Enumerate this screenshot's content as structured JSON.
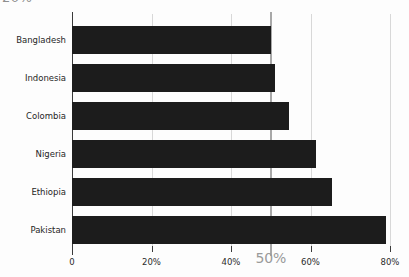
{
  "title_fragment": "20%",
  "chart_data": {
    "type": "bar",
    "orientation": "horizontal",
    "title": "",
    "subtitle": "",
    "xlabel": "",
    "ylabel": "",
    "categories": [
      "Bangladesh",
      "Indonesia",
      "Colombia",
      "Nigeria",
      "Ethiopia",
      "Pakistan"
    ],
    "values": [
      50,
      51,
      54.5,
      61.5,
      65.5,
      79
    ],
    "series": [
      {
        "name": "",
        "values": [
          50,
          51,
          54.5,
          61.5,
          65.5,
          79
        ]
      }
    ],
    "xlim": [
      0,
      80
    ],
    "ylim": null,
    "grid": true,
    "grid_axis": "x",
    "legend": false,
    "legend_position": "none",
    "bar_color": "#1c1c1c",
    "gridline_color": "#d8d8d8",
    "reference_line": {
      "value": 50,
      "label": "50%",
      "color": "#a8a8a8",
      "label_color": "#9a9a9a"
    },
    "xticks": [
      {
        "value": 0,
        "label": "0",
        "emphasis": false
      },
      {
        "value": 20,
        "label": "20%",
        "emphasis": false
      },
      {
        "value": 40,
        "label": "40%",
        "emphasis": false
      },
      {
        "value": 50,
        "label": "50%",
        "emphasis": true
      },
      {
        "value": 60,
        "label": "60%",
        "emphasis": false
      },
      {
        "value": 80,
        "label": "80%",
        "emphasis": false
      }
    ],
    "gridline_values": [
      20,
      40,
      60,
      80
    ],
    "annotations": []
  }
}
